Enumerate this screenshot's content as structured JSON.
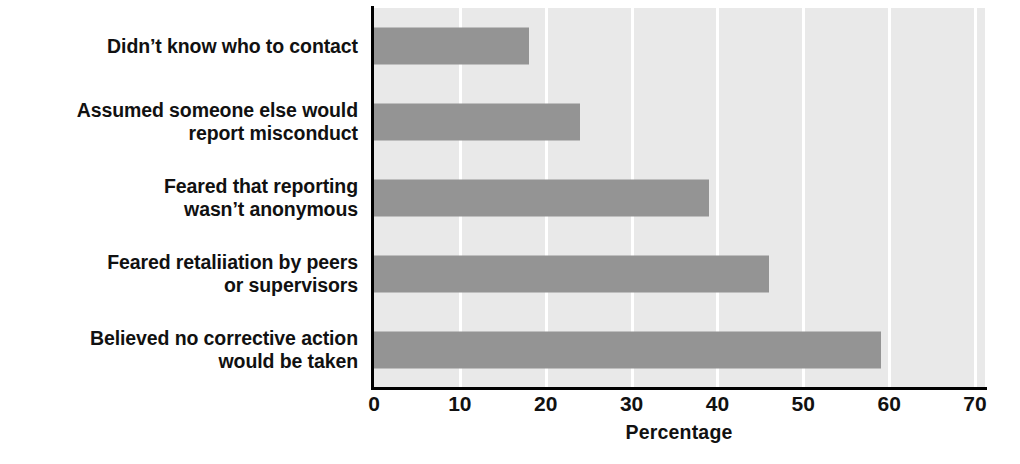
{
  "chart_data": {
    "type": "bar",
    "orientation": "horizontal",
    "title": "",
    "subtitle": "",
    "xlabel": "Percentage",
    "ylabel": "",
    "xlim": [
      0,
      70
    ],
    "xticks": [
      0,
      10,
      20,
      30,
      40,
      50,
      60,
      70
    ],
    "xtick_labels": [
      "0",
      "10",
      "20",
      "30",
      "40",
      "50",
      "60",
      "70"
    ],
    "grid": true,
    "grid_axis": "x",
    "legend": false,
    "categories": [
      "Didn’t know who to contact",
      "Assumed someone else would\nreport misconduct",
      "Feared that reporting\nwasn’t anonymous",
      "Feared retaliiation by peers\nor supervisors",
      "Believed no corrective action\nwould be taken"
    ],
    "values": [
      18,
      24,
      39,
      46,
      59
    ],
    "colors": {
      "bar": "#949494",
      "plot_background": "#e9e9e9",
      "gridline": "#ffffff",
      "axis": "#000000",
      "text": "#111111",
      "page_background": "#ffffff"
    }
  },
  "axis": {
    "title": "Percentage",
    "ticks": [
      "0",
      "10",
      "20",
      "30",
      "40",
      "50",
      "60",
      "70"
    ]
  },
  "labels": [
    {
      "text": "Didn’t know who to contact"
    },
    {
      "text": "Assumed someone else would\nreport misconduct"
    },
    {
      "text": "Feared that reporting\nwasn’t anonymous"
    },
    {
      "text": "Feared retaliiation by peers\nor supervisors"
    },
    {
      "text": "Believed no corrective action\nwould be taken"
    }
  ]
}
